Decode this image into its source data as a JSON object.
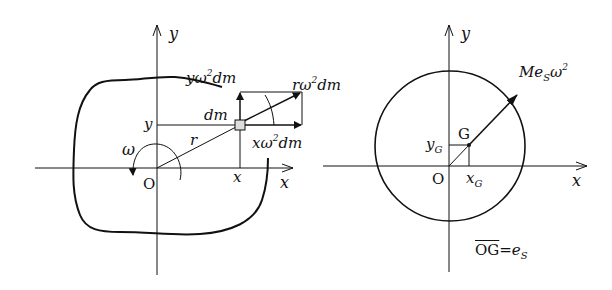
{
  "left_figure": {
    "axis_x_label": "x",
    "axis_y_label": "y",
    "origin_label": "O",
    "omega_label": "ω",
    "r_label": "r",
    "dm_label": "dm",
    "x_coord_label": "x",
    "y_coord_label": "y",
    "force_y": {
      "base": "yω",
      "power": "2",
      "tail": "dm"
    },
    "force_r": {
      "base": "rω",
      "power": "2",
      "tail": "dm"
    },
    "force_x": {
      "base": "xω",
      "power": "2",
      "tail": "dm"
    }
  },
  "right_figure": {
    "axis_x_label": "x",
    "axis_y_label": "y",
    "origin_label": "O",
    "g_label": "G",
    "xg_label": {
      "base": "x",
      "sub": "G"
    },
    "yg_label": {
      "base": "y",
      "sub": "G"
    },
    "force_label": {
      "pre": "Me",
      "sub": "S",
      "base": "ω",
      "power": "2"
    },
    "equation": {
      "lhs": "OG",
      "eq": "=",
      "rhs": "e",
      "rhs_sub": "S"
    }
  },
  "colors": {
    "stroke": "#111111",
    "background": "#ffffff"
  }
}
